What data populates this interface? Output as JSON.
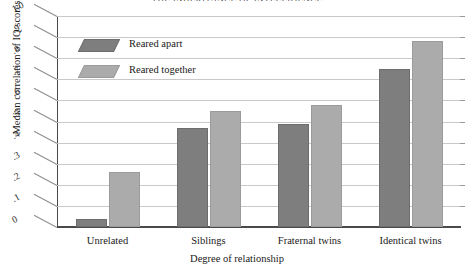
{
  "chart_data": {
    "type": "bar",
    "title": "THE INHERITANCE OF INTELLIGENCE",
    "xlabel": "Degree of relationship",
    "ylabel": "Median correlation of IQ scores",
    "categories": [
      "Unrelated",
      "Siblings",
      "Fraternal twins",
      "Identical twins"
    ],
    "series": [
      {
        "name": "Reared apart",
        "color": "#7e7e7e",
        "values": [
          0.04,
          0.47,
          0.49,
          0.75
        ]
      },
      {
        "name": "Reared together",
        "color": "#ababab",
        "values": [
          0.26,
          0.55,
          0.58,
          0.88
        ]
      }
    ],
    "ylim": [
      0,
      1.0
    ],
    "ytick_values": [
      0,
      0.1,
      0.2,
      0.3,
      0.4,
      0.5,
      0.6,
      0.7,
      0.8,
      0.9,
      1.0
    ],
    "ytick_labels": [
      "0",
      ".1",
      ".2",
      ".3",
      ".4",
      ".5",
      ".6",
      ".7",
      ".8",
      ".9",
      "1.0"
    ],
    "grid": true,
    "legend_position": "top-left-inside",
    "style": "3d-perspective-grayscale"
  }
}
